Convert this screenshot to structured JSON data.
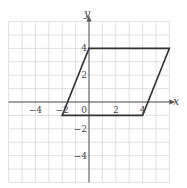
{
  "chart_data": {
    "type": "diagram",
    "title": "",
    "xlabel": "x",
    "ylabel": "y",
    "xlim": [
      -6,
      6
    ],
    "ylim": [
      -6,
      6
    ],
    "grid": true,
    "x_ticks": [
      {
        "value": -4,
        "label": "−4"
      },
      {
        "value": -2,
        "label": "−2"
      },
      {
        "value": 0,
        "label": "0"
      },
      {
        "value": 2,
        "label": "2"
      },
      {
        "value": 4,
        "label": "4"
      }
    ],
    "y_ticks": [
      {
        "value": 4,
        "label": "4"
      },
      {
        "value": 2,
        "label": "2"
      },
      {
        "value": -2,
        "label": "−2"
      },
      {
        "value": -4,
        "label": "−4"
      }
    ],
    "shape": {
      "name": "parallelogram",
      "vertices": [
        [
          0,
          4
        ],
        [
          6,
          4
        ],
        [
          4,
          -1
        ],
        [
          -2,
          -1
        ]
      ]
    }
  },
  "axes": {
    "x_label": "x",
    "y_label": "y"
  }
}
